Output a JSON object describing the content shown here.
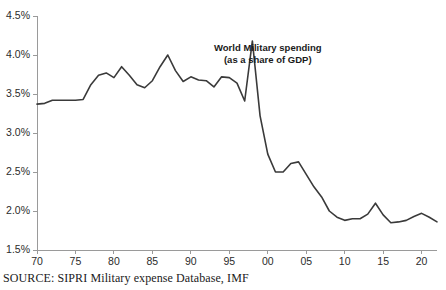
{
  "source_note": "SOURCE: SIPRI Military expense Database, IMF",
  "annotation": {
    "line1": "World Military spending",
    "line2": "(as a share of GDP)"
  },
  "colors": {
    "line": "#3a3a3a",
    "axis": "#9a9a9a",
    "text": "#1a1a1a",
    "background": "#ffffff"
  },
  "chart_data": {
    "type": "line",
    "subtitle": "",
    "xlabel": "",
    "ylabel": "",
    "xlim": [
      1970,
      2022
    ],
    "ylim": [
      1.5,
      4.5
    ],
    "grid": false,
    "legend": "none",
    "annotations": [
      {
        "text": "World Military spending (as a share of GDP)",
        "x": 2000,
        "y": 4.05
      }
    ],
    "y_ticks": [
      1.5,
      2.0,
      2.5,
      3.0,
      3.5,
      4.0,
      4.5
    ],
    "y_tick_labels": [
      "1.5%",
      "2.0%",
      "2.5%",
      "3.0%",
      "3.5%",
      "4.0%",
      "4.5%"
    ],
    "x_ticks": [
      1970,
      1975,
      1980,
      1985,
      1990,
      1995,
      2000,
      2005,
      2010,
      2015,
      2020
    ],
    "x_tick_labels": [
      "70",
      "75",
      "80",
      "85",
      "90",
      "95",
      "00",
      "05",
      "10",
      "15",
      "20"
    ],
    "series": [
      {
        "name": "World military spending (% of GDP)",
        "x": [
          1970,
          1971,
          1972,
          1973,
          1974,
          1975,
          1976,
          1977,
          1978,
          1979,
          1980,
          1981,
          1982,
          1983,
          1984,
          1985,
          1986,
          1987,
          1988,
          1989,
          1990,
          1991,
          1992,
          1993,
          1994,
          1995,
          1996,
          1997,
          1998,
          1999,
          2000,
          2001,
          2002,
          2003,
          2004,
          2005,
          2006,
          2007,
          2008,
          2009,
          2010,
          2011,
          2012,
          2013,
          2014,
          2015,
          2016,
          2017,
          2018,
          2019,
          2020,
          2021,
          2022
        ],
        "values": [
          3.37,
          3.38,
          3.42,
          3.42,
          3.42,
          3.42,
          3.43,
          3.62,
          3.74,
          3.77,
          3.71,
          3.85,
          3.74,
          3.62,
          3.58,
          3.67,
          3.85,
          4.0,
          3.8,
          3.66,
          3.72,
          3.68,
          3.67,
          3.59,
          3.72,
          3.71,
          3.64,
          3.41,
          4.18,
          3.22,
          2.73,
          2.5,
          2.5,
          2.61,
          2.63,
          2.47,
          2.31,
          2.18,
          2.0,
          1.92,
          1.88,
          1.9,
          1.9,
          1.96,
          2.1,
          1.95,
          1.85,
          1.86,
          1.88,
          1.93,
          1.97,
          1.92,
          1.86
        ]
      }
    ]
  },
  "plot_geometry": {
    "left": 37,
    "right": 437,
    "top": 16,
    "bottom": 250
  }
}
